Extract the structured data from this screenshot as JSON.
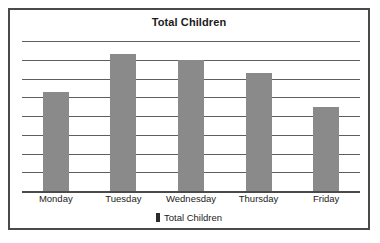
{
  "chart": {
    "title": "Total Children",
    "frame_border_color": "#4a4a4a",
    "bar_color": "#8a8a8a",
    "gridline_color": "#5e5e5e",
    "legend": {
      "swatch_color": "#2b2b2b",
      "label": "Total Children"
    }
  },
  "chart_data": {
    "type": "bar",
    "title": "Total Children",
    "xlabel": "",
    "ylabel": "",
    "categories": [
      "Monday",
      "Tuesday",
      "Wednesday",
      "Thursday",
      "Friday"
    ],
    "values": [
      5.3,
      7.3,
      7.0,
      6.3,
      4.5
    ],
    "series": [
      {
        "name": "Total Children",
        "values": [
          5.3,
          7.3,
          7.0,
          6.3,
          4.5
        ]
      }
    ],
    "ylim": [
      0,
      8
    ],
    "gridlines": [
      1,
      2,
      3,
      4,
      5,
      6,
      7,
      8
    ],
    "grid": true,
    "tick_labels_visible": false,
    "legend_position": "bottom"
  }
}
